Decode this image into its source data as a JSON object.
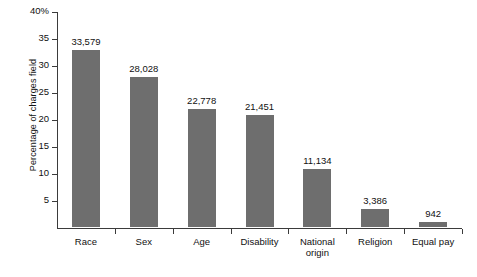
{
  "chart_data": {
    "type": "bar",
    "title": "",
    "subtitle": "",
    "xlabel": "",
    "ylabel": "Percentage of charges field",
    "ylim": [
      0,
      40
    ],
    "yunit": "%",
    "grid": false,
    "legend": "none",
    "orientation": "vertical",
    "bar_color": "#6e6e6e",
    "axis_color": "#3b3b3b",
    "background": "#ffffff",
    "ytick_labels": [
      "40%",
      "35",
      "30",
      "25",
      "20",
      "15",
      "10",
      "5"
    ],
    "ytick_values": [
      40,
      35,
      30,
      25,
      20,
      15,
      10,
      5
    ],
    "categories": [
      "Race",
      "Sex",
      "Age",
      "Disability",
      "National origin",
      "Religion",
      "Equal pay"
    ],
    "category_lines": [
      [
        "Race"
      ],
      [
        "Sex"
      ],
      [
        "Age"
      ],
      [
        "Disability"
      ],
      [
        "National",
        "origin"
      ],
      [
        "Religion"
      ],
      [
        "Equal pay"
      ]
    ],
    "values": [
      32.8,
      27.8,
      21.9,
      20.8,
      10.8,
      3.3,
      0.9
    ],
    "data_labels": [
      "33,579",
      "28,028",
      "22,778",
      "21,451",
      "11,134",
      "3,386",
      "942"
    ],
    "counts": [
      33579,
      28028,
      22778,
      21451,
      11134,
      3386,
      942
    ],
    "series": [
      {
        "name": "Percentage of charges field",
        "values": [
          32.8,
          27.8,
          21.9,
          20.8,
          10.8,
          3.3,
          0.9
        ],
        "labels": [
          "33,579",
          "28,028",
          "22,778",
          "21,451",
          "11,134",
          "3,386",
          "942"
        ]
      }
    ]
  }
}
